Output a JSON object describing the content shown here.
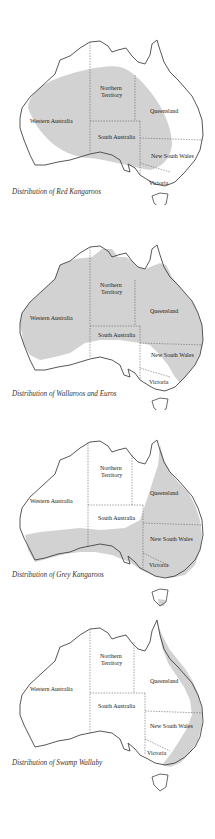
{
  "colors": {
    "range_fill": "#d2d2d2",
    "coast": "#444444",
    "border": "#666666",
    "background": "#ffffff"
  },
  "state_labels": {
    "wa": "Western Australia",
    "nt1": "Northern",
    "nt2": "Territory",
    "qld": "Queensland",
    "sa": "South Australia",
    "nsw": "New South Wales",
    "vic": "Victoria"
  },
  "maps": [
    {
      "caption": "Distribution of Red Kangaroos",
      "range": "central-inland"
    },
    {
      "caption": "Distribution of Wallaroos and Euros",
      "range": "most-of-mainland"
    },
    {
      "caption": "Distribution of Grey Kangaroos",
      "range": "east-and-south"
    },
    {
      "caption": "Distribution of Swamp Wallaby",
      "range": "east-coast-strip"
    }
  ]
}
